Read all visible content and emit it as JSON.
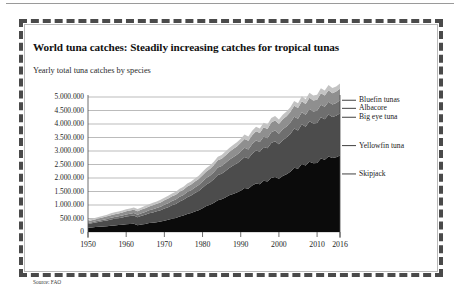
{
  "figure": {
    "title": "World tuna catches: Steadily increasing catches for tropical tunas",
    "subtitle": "Yearly total tuna catches by species",
    "source": "Source: FAO"
  },
  "chart_data": {
    "type": "area",
    "stacked": true,
    "title": "World tuna catches: Steadily increasing catches for tropical tunas",
    "subtitle": "Yearly total tuna catches by species",
    "xlabel": "",
    "ylabel": "",
    "grid": true,
    "legend_position": "right",
    "xlim": [
      1950,
      2016
    ],
    "ylim": [
      0,
      5000000
    ],
    "ytick_labels": [
      "5.000.000",
      "4.500.000",
      "4.000.000",
      "3.500.000",
      "3.000.000",
      "2.500.000",
      "2.000.000",
      "1.500.000",
      "1.000.000",
      "500.000",
      "0"
    ],
    "ytick_values": [
      5000000,
      4500000,
      4000000,
      3500000,
      3000000,
      2500000,
      2000000,
      1500000,
      1000000,
      500000,
      0
    ],
    "xtick_labels": [
      "1950",
      "1960",
      "1970",
      "1980",
      "1990",
      "2000",
      "2010",
      "2016"
    ],
    "xtick_values": [
      1950,
      1960,
      1970,
      1980,
      1990,
      2000,
      2010,
      2016
    ],
    "x": [
      1950,
      1951,
      1952,
      1953,
      1954,
      1955,
      1956,
      1957,
      1958,
      1959,
      1960,
      1961,
      1962,
      1963,
      1964,
      1965,
      1966,
      1967,
      1968,
      1969,
      1970,
      1971,
      1972,
      1973,
      1974,
      1975,
      1976,
      1977,
      1978,
      1979,
      1980,
      1981,
      1982,
      1983,
      1984,
      1985,
      1986,
      1987,
      1988,
      1989,
      1990,
      1991,
      1992,
      1993,
      1994,
      1995,
      1996,
      1997,
      1998,
      1999,
      2000,
      2001,
      2002,
      2003,
      2004,
      2005,
      2006,
      2007,
      2008,
      2009,
      2010,
      2011,
      2012,
      2013,
      2014,
      2015,
      2016
    ],
    "series": [
      {
        "name": "Skipjack",
        "color": "#0b0b0b",
        "values": [
          160000,
          170000,
          185000,
          195000,
          205000,
          215000,
          235000,
          245000,
          255000,
          270000,
          290000,
          300000,
          310000,
          250000,
          280000,
          300000,
          330000,
          345000,
          365000,
          385000,
          420000,
          450000,
          490000,
          520000,
          570000,
          610000,
          670000,
          700000,
          760000,
          810000,
          880000,
          960000,
          1010000,
          1080000,
          1180000,
          1210000,
          1280000,
          1360000,
          1410000,
          1460000,
          1530000,
          1630000,
          1600000,
          1720000,
          1800000,
          1770000,
          1900000,
          1870000,
          2000000,
          2040000,
          1970000,
          2070000,
          2140000,
          2230000,
          2380000,
          2340000,
          2520000,
          2460000,
          2600000,
          2550000,
          2560000,
          2720000,
          2680000,
          2800000,
          2740000,
          2770000,
          2830000
        ]
      },
      {
        "name": "Yellowfin tuna",
        "color": "#4c4c4c",
        "values": [
          140000,
          155000,
          170000,
          185000,
          200000,
          215000,
          230000,
          245000,
          255000,
          265000,
          280000,
          290000,
          300000,
          300000,
          320000,
          340000,
          360000,
          380000,
          400000,
          420000,
          450000,
          470000,
          500000,
          520000,
          560000,
          580000,
          620000,
          650000,
          680000,
          710000,
          760000,
          800000,
          830000,
          880000,
          930000,
          950000,
          980000,
          1010000,
          1050000,
          1080000,
          1120000,
          1150000,
          1120000,
          1180000,
          1220000,
          1200000,
          1250000,
          1230000,
          1300000,
          1320000,
          1280000,
          1330000,
          1360000,
          1400000,
          1450000,
          1420000,
          1470000,
          1440000,
          1500000,
          1470000,
          1480000,
          1530000,
          1500000,
          1550000,
          1520000,
          1540000,
          1570000
        ]
      },
      {
        "name": "Big eye tuna",
        "color": "#6f6f6f",
        "values": [
          30000,
          35000,
          40000,
          45000,
          50000,
          55000,
          60000,
          65000,
          70000,
          75000,
          80000,
          85000,
          90000,
          92000,
          98000,
          105000,
          112000,
          118000,
          125000,
          132000,
          140000,
          148000,
          155000,
          162000,
          172000,
          180000,
          190000,
          198000,
          208000,
          218000,
          230000,
          240000,
          250000,
          262000,
          275000,
          282000,
          292000,
          302000,
          312000,
          322000,
          335000,
          345000,
          340000,
          355000,
          368000,
          362000,
          378000,
          372000,
          392000,
          400000,
          388000,
          402000,
          412000,
          425000,
          440000,
          432000,
          448000,
          438000,
          455000,
          446000,
          450000,
          465000,
          458000,
          472000,
          462000,
          468000,
          478000
        ]
      },
      {
        "name": "Albacore",
        "color": "#8f8f8f",
        "values": [
          70000,
          75000,
          80000,
          85000,
          90000,
          95000,
          100000,
          105000,
          108000,
          112000,
          118000,
          122000,
          126000,
          128000,
          132000,
          138000,
          142000,
          148000,
          152000,
          158000,
          165000,
          170000,
          176000,
          182000,
          190000,
          196000,
          204000,
          210000,
          218000,
          225000,
          235000,
          242000,
          250000,
          258000,
          268000,
          274000,
          282000,
          290000,
          298000,
          306000,
          316000,
          324000,
          318000,
          332000,
          342000,
          336000,
          350000,
          344000,
          360000,
          368000,
          358000,
          370000,
          378000,
          390000,
          402000,
          396000,
          408000,
          400000,
          414000,
          406000,
          410000,
          422000,
          416000,
          428000,
          420000,
          424000,
          432000
        ]
      },
      {
        "name": "Bluefin tunas",
        "color": "#c3c3c3",
        "values": [
          50000,
          52000,
          55000,
          58000,
          60000,
          63000,
          66000,
          68000,
          70000,
          72000,
          75000,
          77000,
          79000,
          80000,
          82000,
          85000,
          87000,
          90000,
          92000,
          95000,
          98000,
          100000,
          103000,
          105000,
          108000,
          110000,
          113000,
          115000,
          118000,
          120000,
          124000,
          127000,
          130000,
          133000,
          137000,
          140000,
          143000,
          146000,
          149000,
          152000,
          156000,
          158000,
          156000,
          160000,
          164000,
          162000,
          166000,
          164000,
          170000,
          172000,
          168000,
          172000,
          175000,
          178000,
          182000,
          180000,
          184000,
          181000,
          186000,
          183000,
          185000,
          188000,
          186000,
          190000,
          187000,
          188000,
          191000
        ]
      }
    ],
    "legend_entries": [
      {
        "label": "Bluefin tunas",
        "color": "#c3c3c3"
      },
      {
        "label": "Albacore",
        "color": "#8f8f8f"
      },
      {
        "label": "Big eye tuna",
        "color": "#6f6f6f"
      },
      {
        "label": "Yellowfin tuna",
        "color": "#4c4c4c"
      },
      {
        "label": "Skipjack",
        "color": "#0b0b0b"
      }
    ],
    "legend_anchor_values": [
      4880000,
      4580000,
      4250000,
      3200000,
      2150000
    ]
  }
}
